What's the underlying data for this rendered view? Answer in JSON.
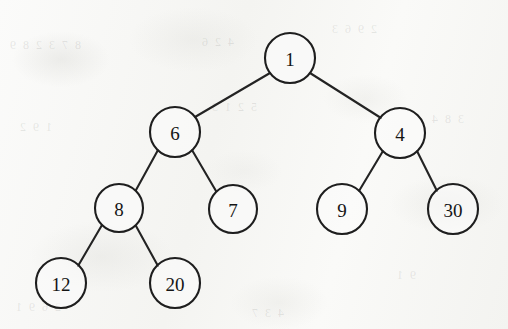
{
  "figure": {
    "kind": "binary-tree-diagram",
    "background_color": "#f7f7f5",
    "stroke_color": "#232323",
    "node_fill_color": "#fcfcfb",
    "label_color": "#151515",
    "ghost_marks": [
      {
        "text": "8 7 3 2 8 9",
        "x": 8,
        "y": 38
      },
      {
        "text": "4 2 6",
        "x": 200,
        "y": 35
      },
      {
        "text": "2 9 6 3",
        "x": 330,
        "y": 22
      },
      {
        "text": "1 9 2",
        "x": 18,
        "y": 120
      },
      {
        "text": "5 2 1 3",
        "x": 210,
        "y": 100
      },
      {
        "text": "3 8 4",
        "x": 430,
        "y": 112
      },
      {
        "text": "2 6 9 1",
        "x": 14,
        "y": 300
      },
      {
        "text": "4 3 7",
        "x": 250,
        "y": 306
      },
      {
        "text": "9 1",
        "x": 395,
        "y": 268
      }
    ],
    "nodes": [
      {
        "id": "n1",
        "value": "1",
        "cx": 290,
        "cy": 58,
        "r": 25
      },
      {
        "id": "n6",
        "value": "6",
        "cx": 175,
        "cy": 132,
        "r": 25
      },
      {
        "id": "n4",
        "value": "4",
        "cx": 400,
        "cy": 133,
        "r": 25
      },
      {
        "id": "n8",
        "value": "8",
        "cx": 119,
        "cy": 208,
        "r": 24
      },
      {
        "id": "n7",
        "value": "7",
        "cx": 233,
        "cy": 209,
        "r": 24
      },
      {
        "id": "n9",
        "value": "9",
        "cx": 342,
        "cy": 209,
        "r": 25
      },
      {
        "id": "n30",
        "value": "30",
        "cx": 453,
        "cy": 209,
        "r": 25
      },
      {
        "id": "n12",
        "value": "12",
        "cx": 61,
        "cy": 283,
        "r": 25
      },
      {
        "id": "n20",
        "value": "20",
        "cx": 175,
        "cy": 283,
        "r": 25
      }
    ],
    "edges": [
      {
        "id": "e1",
        "from": "n1",
        "to": "n6",
        "x1": 270,
        "y1": 73,
        "x2": 195,
        "y2": 117
      },
      {
        "id": "e2",
        "from": "n1",
        "to": "n4",
        "x1": 310,
        "y1": 73,
        "x2": 381,
        "y2": 118
      },
      {
        "id": "e3",
        "from": "n6",
        "to": "n8",
        "x1": 158,
        "y1": 150,
        "x2": 136,
        "y2": 190
      },
      {
        "id": "e4",
        "from": "n6",
        "to": "n7",
        "x1": 192,
        "y1": 150,
        "x2": 216,
        "y2": 191
      },
      {
        "id": "e5",
        "from": "n8",
        "to": "n12",
        "x1": 102,
        "y1": 225,
        "x2": 78,
        "y2": 266
      },
      {
        "id": "e6",
        "from": "n8",
        "to": "n20",
        "x1": 136,
        "y1": 226,
        "x2": 158,
        "y2": 266
      },
      {
        "id": "e7",
        "from": "n4",
        "to": "n9",
        "x1": 383,
        "y1": 151,
        "x2": 359,
        "y2": 191
      },
      {
        "id": "e8",
        "from": "n4",
        "to": "n30",
        "x1": 417,
        "y1": 151,
        "x2": 437,
        "y2": 191
      }
    ]
  },
  "chart_data": {
    "type": "diagram",
    "title": "",
    "structure": "binary tree",
    "root": "1",
    "adjacency": [
      {
        "parent": "1",
        "left": "6",
        "right": "4"
      },
      {
        "parent": "6",
        "left": "8",
        "right": "7"
      },
      {
        "parent": "8",
        "left": "12",
        "right": "20"
      },
      {
        "parent": "4",
        "left": "9",
        "right": "30"
      }
    ],
    "levels": [
      [
        "1"
      ],
      [
        "6",
        "4"
      ],
      [
        "8",
        "7",
        "9",
        "30"
      ],
      [
        "12",
        "20"
      ]
    ],
    "node_values": [
      "1",
      "6",
      "4",
      "8",
      "7",
      "9",
      "30",
      "12",
      "20"
    ],
    "node_count": 9,
    "edge_count": 8,
    "depth": 4
  }
}
